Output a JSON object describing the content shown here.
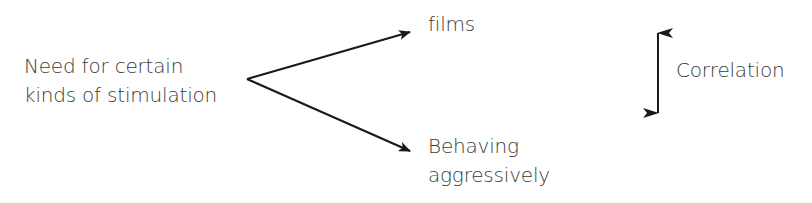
{
  "diagram": {
    "cause": {
      "line1": "Need for certain",
      "line2": "kinds of stimulation"
    },
    "effect_top": {
      "label": "films"
    },
    "effect_bottom": {
      "line1": "Behaving",
      "line2": "aggressively"
    },
    "legend": {
      "icon": "double-headed-vertical-arrow",
      "label": "Correlation"
    },
    "colors": {
      "text": "#3a3a3a",
      "arrow": "#1a1a1a",
      "background": "#ffffff"
    }
  }
}
